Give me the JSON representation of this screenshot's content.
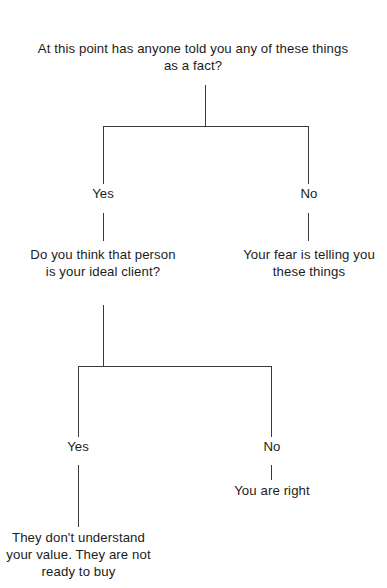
{
  "diagram": {
    "line_color": "#3a3a3a",
    "text_color": "#1c1c1c",
    "background": "#ffffff",
    "nodes": {
      "root_question": "At this point has anyone told you any of these things as a fact?",
      "ideal_client_question": "Do you think that person is your ideal client?",
      "fear_outcome": "Your fear is telling you these things",
      "you_are_right_outcome": "You are right",
      "not_ready_outcome": "They don't understand your value. They are not ready to buy"
    },
    "edge_labels": {
      "root_yes": "Yes",
      "root_no": "No",
      "ideal_yes": "Yes",
      "ideal_no": "No"
    }
  }
}
